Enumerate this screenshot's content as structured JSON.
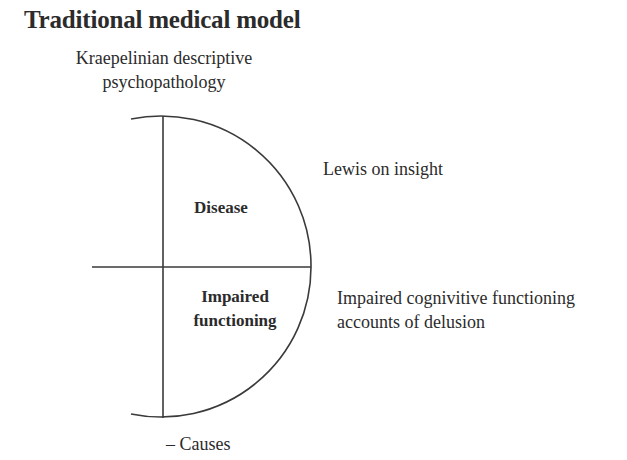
{
  "title": "Traditional medical model",
  "top_label": {
    "line1": "Kraepelinian descriptive",
    "line2": "psychopathology"
  },
  "quadrants": {
    "upper": "Disease",
    "lower": {
      "line1": "Impaired",
      "line2": "functioning"
    }
  },
  "right_labels": {
    "upper": "Lewis on insight",
    "lower": {
      "line1": "Impaired cognivitive functioning",
      "line2": "accounts of delusion"
    }
  },
  "bottom_label": "– Causes",
  "colors": {
    "ink": "#2b2b2b",
    "background": "#ffffff"
  }
}
